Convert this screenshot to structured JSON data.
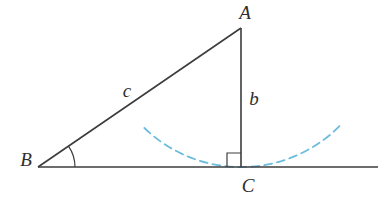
{
  "diagram": {
    "type": "geometry-right-triangle-construction",
    "labels": {
      "vertex_a": "A",
      "vertex_b": "B",
      "vertex_c": "C",
      "side_c": "c",
      "side_b": "b"
    },
    "colors": {
      "line": "#3c3c3c",
      "text": "#2e2e2e",
      "construction_arc": "#6cbcde",
      "background": "#ffffff"
    },
    "geometry": {
      "points": {
        "A": {
          "x": 241,
          "y": 28
        },
        "B": {
          "x": 38,
          "y": 167
        },
        "C": {
          "x": 241,
          "y": 167
        }
      },
      "base_line": {
        "x1": 38,
        "y1": 167,
        "x2": 378,
        "y2": 167
      },
      "angle_arc_radius": 37,
      "right_angle_size": 14,
      "compass_arc": {
        "center": "A",
        "start_deg": 134,
        "end_deg": 44
      },
      "label_positions": {
        "A": {
          "x": 245,
          "y": 19
        },
        "B": {
          "x": 26,
          "y": 166
        },
        "C": {
          "x": 248,
          "y": 192
        },
        "c": {
          "x": 127,
          "y": 97
        },
        "b": {
          "x": 254,
          "y": 105
        }
      }
    }
  }
}
